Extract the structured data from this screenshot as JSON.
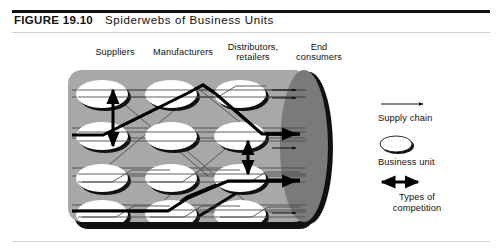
{
  "figure": {
    "label": "FIGURE 19.10",
    "title": "Spiderwebs of Business Units"
  },
  "columns": [
    {
      "id": "suppliers",
      "label": "Suppliers"
    },
    {
      "id": "manufacturers",
      "label": "Manufacturers"
    },
    {
      "id": "distributors",
      "label": "Distributors,\nretailers",
      "line1": "Distributors,",
      "line2": "retailers"
    },
    {
      "id": "end-consumers",
      "label": "End\nconsumers",
      "line1": "End",
      "line2": "consumers"
    }
  ],
  "legend": {
    "items": [
      {
        "id": "supply-chain",
        "label": "Supply chain",
        "symbol": "arrow-right-icon"
      },
      {
        "id": "business-unit",
        "label": "Business unit",
        "symbol": "ellipse-icon"
      },
      {
        "id": "types-competition",
        "label": "Types of competition",
        "line1": "Types of",
        "line2": "competition",
        "symbol": "double-arrow-icon"
      }
    ]
  },
  "diagram": {
    "grid": {
      "rows": 4,
      "cols": 3,
      "node_count": 12
    },
    "end_consumer_node": {
      "shape": "large-dark-ellipse"
    }
  },
  "colors": {
    "panel_fill": "#a8a8a8",
    "panel_shadow": "#111111",
    "node_fill": "#ffffff",
    "node_shadow": "#111111",
    "end_node_fill": "#7a7a7a",
    "thin_line": "#555555",
    "thick_line": "#000000",
    "text": "#111111",
    "rule_light": "#d3d3d3"
  }
}
